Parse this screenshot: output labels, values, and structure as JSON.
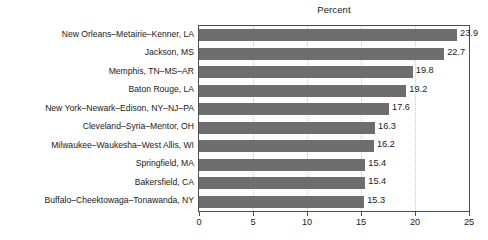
{
  "chart_data": {
    "type": "bar",
    "orientation": "horizontal",
    "title": "Percent",
    "xlabel": "",
    "ylabel": "",
    "xlim": [
      0,
      25
    ],
    "xticks": [
      0,
      5,
      10,
      15,
      20,
      25
    ],
    "grid": true,
    "legend": null,
    "bar_color": "#6e6e6e",
    "frame_color": "#4d4d4d",
    "gridline_color": "#c9c9c9",
    "categories": [
      "New Orleans–Metairie–Kenner, LA",
      "Jackson, MS",
      "Memphis, TN–MS–AR",
      "Baton Rouge, LA",
      "New York–Newark–Edison, NY–NJ–PA",
      "Cleveland–Syria–Mentor, OH",
      "Milwaukee–Waukesha–West Allis, WI",
      "Springfield, MA",
      "Bakersfield, CA",
      "Buffalo–Cheektowaga–Tonawanda, NY"
    ],
    "values": [
      23.9,
      22.7,
      19.8,
      19.2,
      17.6,
      16.3,
      16.2,
      15.4,
      15.4,
      15.3
    ],
    "value_labels": [
      "23.9",
      "22.7",
      "19.8",
      "19.2",
      "17.6",
      "16.3",
      "16.2",
      "15.4",
      "15.4",
      "15.3"
    ],
    "tick_labels": [
      "0",
      "5",
      "10",
      "15",
      "20",
      "25"
    ]
  }
}
